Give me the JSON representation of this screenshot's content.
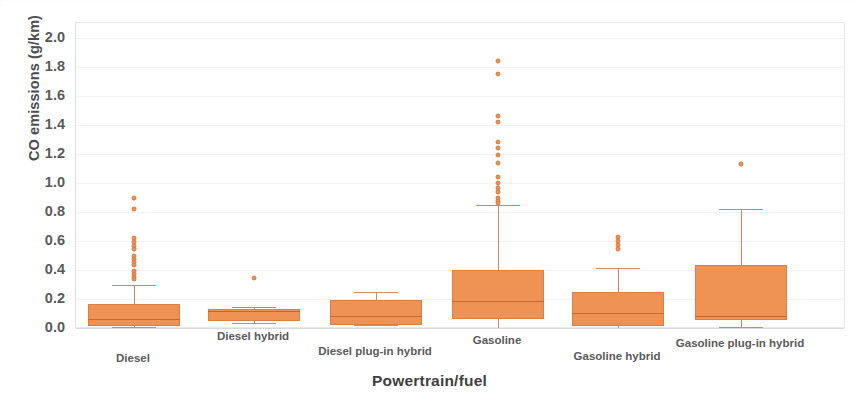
{
  "chart_data": {
    "type": "box",
    "title": "",
    "xlabel": "Powertrain/fuel",
    "ylabel": "CO emissions (g/km)",
    "ylim": [
      0.0,
      2.0
    ],
    "ytick_step": 0.2,
    "yticks": [
      "2.0",
      "1.8",
      "1.6",
      "1.4",
      "1.2",
      "1.0",
      "0.8",
      "0.6",
      "0.4",
      "0.2",
      "0.0"
    ],
    "ytick_values": [
      2.0,
      1.8,
      1.6,
      1.4,
      1.2,
      1.0,
      0.8,
      0.6,
      0.4,
      0.2,
      0.0
    ],
    "grid": true,
    "legend": null,
    "box_color": "#ef9355",
    "box_edge_color": "#dd7f3f",
    "median_color": "#c4692f",
    "whisker_color": "#d08b5c",
    "categories": [
      "Diesel",
      "Diesel hybrid",
      "Diesel plug-in hybrid",
      "Gasoline",
      "Gasoline hybrid",
      "Gasoline plug-in hybrid"
    ],
    "boxes": [
      {
        "category": "Diesel",
        "whisker_low": 0.01,
        "q1": 0.015,
        "median": 0.065,
        "q3": 0.165,
        "whisker_high": 0.3,
        "outliers": [
          0.9,
          0.82,
          0.62,
          0.595,
          0.565,
          0.545,
          0.5,
          0.475,
          0.455,
          0.435,
          0.395,
          0.375,
          0.355,
          0.335
        ]
      },
      {
        "category": "Diesel hybrid",
        "whisker_low": 0.035,
        "q1": 0.05,
        "median": 0.115,
        "q3": 0.13,
        "whisker_high": 0.145,
        "outliers": [
          0.345
        ]
      },
      {
        "category": "Diesel plug-in hybrid",
        "whisker_low": 0.02,
        "q1": 0.02,
        "median": 0.085,
        "q3": 0.19,
        "whisker_high": 0.25,
        "outliers": []
      },
      {
        "category": "Gasoline",
        "whisker_low": 0.0,
        "q1": 0.06,
        "median": 0.185,
        "q3": 0.4,
        "whisker_high": 0.85,
        "outliers": [
          1.84,
          1.75,
          1.46,
          1.42,
          1.28,
          1.24,
          1.19,
          1.14,
          1.04,
          1.0,
          0.965,
          0.935,
          0.9,
          0.875,
          0.86
        ]
      },
      {
        "category": "Gasoline hybrid",
        "whisker_low": 0.0,
        "q1": 0.015,
        "median": 0.105,
        "q3": 0.245,
        "whisker_high": 0.415,
        "outliers": [
          0.625,
          0.6,
          0.575,
          0.545
        ]
      },
      {
        "category": "Gasoline plug-in hybrid",
        "whisker_low": 0.01,
        "q1": 0.055,
        "median": 0.085,
        "q3": 0.435,
        "whisker_high": 0.82,
        "outliers": [
          1.13
        ]
      }
    ]
  }
}
